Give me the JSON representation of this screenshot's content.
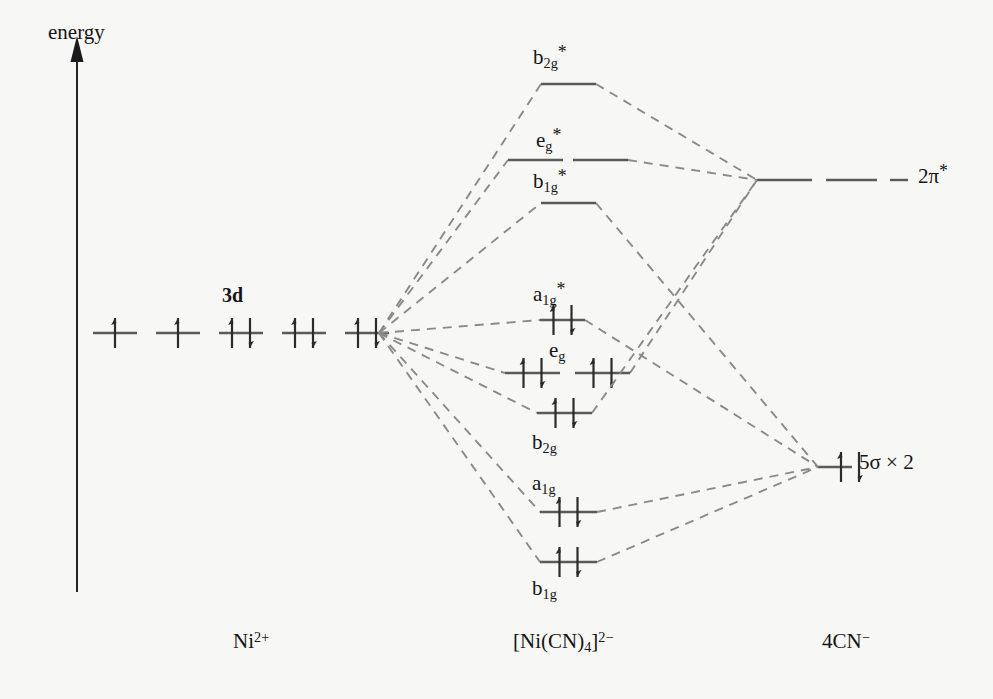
{
  "diagram": {
    "axis": {
      "label": "energy",
      "direction": "up"
    },
    "colors": {
      "background": "#f7f7f5",
      "level_line": "#5a5a5a",
      "correlation_line": "#8a8a8a",
      "axis": "#1a1a1a",
      "text": "#151515",
      "electron_arrow": "#2b2b2b"
    },
    "columns": [
      {
        "id": "metal",
        "label_text": "Ni",
        "label_sup": "2+",
        "x": 281
      },
      {
        "id": "complex",
        "label_text": "[Ni(CN)",
        "label_sub": "4",
        "label_tail": "]",
        "label_sup": "2−",
        "x": 610
      },
      {
        "id": "ligand",
        "label_text": "4CN",
        "label_sup": "−",
        "x": 855
      }
    ],
    "bottom_labels": [
      {
        "name": "metal-label",
        "html": "Ni<sup>2+</sup>",
        "x": 233,
        "y": 630
      },
      {
        "name": "complex-label",
        "html": "[Ni(CN)<sub>4</sub>]<sup>2−</sup>",
        "x": 513,
        "y": 630
      },
      {
        "name": "ligand-label",
        "html": "4CN<sup>−</sup>",
        "x": 822,
        "y": 630
      }
    ],
    "metal_levels": {
      "group_label": "3d",
      "group_label_x": 222,
      "group_label_y": 285,
      "y": 333,
      "orbitals": [
        {
          "x": 93,
          "width": 44,
          "electrons": "up"
        },
        {
          "x": 156,
          "width": 44,
          "electrons": "up"
        },
        {
          "x": 219,
          "width": 44,
          "electrons": "pair"
        },
        {
          "x": 282,
          "width": 44,
          "electrons": "pair"
        },
        {
          "x": 345,
          "width": 44,
          "electrons": "pair"
        }
      ],
      "converge_x": 379,
      "converge_y": 333
    },
    "mo_levels": [
      {
        "id": "b2g-star",
        "label": "b<sub>2g</sub><span class='star'>*</span>",
        "label_x": 533,
        "label_y": 44,
        "y": 84,
        "segments": [
          [
            541,
            596
          ]
        ],
        "electrons": "none",
        "from": "metal",
        "to": "pi-star"
      },
      {
        "id": "eg-star",
        "label": "e<sub>g</sub><span class='star'>*</span>",
        "label_x": 536,
        "label_y": 127,
        "y": 160,
        "segments": [
          [
            508,
            563
          ],
          [
            573,
            628
          ]
        ],
        "electrons": "none",
        "from": "metal",
        "to": "pi-star"
      },
      {
        "id": "b1g-star",
        "label": "b<sub>1g</sub><span class='star'>*</span>",
        "label_x": 533,
        "label_y": 168,
        "y": 203,
        "segments": [
          [
            541,
            596
          ]
        ],
        "electrons": "none",
        "from": "metal",
        "to": "sigma"
      },
      {
        "id": "a1g-star",
        "label": "a<sub>1g</sub><span class='star'>*</span>",
        "label_x": 533,
        "label_y": 281,
        "y": 320,
        "segments": [
          [
            540,
            585
          ]
        ],
        "electrons": "pair",
        "from": "metal",
        "to": "sigma"
      },
      {
        "id": "eg",
        "label": "e<sub>g</sub>",
        "label_x": 549,
        "label_y": 340,
        "y": 373,
        "segments": [
          [
            505,
            560
          ],
          [
            575,
            630
          ]
        ],
        "electrons": "pair-both",
        "from": "metal",
        "to": "pi-star"
      },
      {
        "id": "b2g",
        "label": "b<sub>2g</sub>",
        "label_x": 532,
        "label_y": 432,
        "y": 413,
        "segments": [
          [
            537,
            592
          ]
        ],
        "electrons": "pair",
        "from": "metal",
        "to": "pi-star"
      },
      {
        "id": "a1g",
        "label": "a<sub>1g</sub>",
        "label_x": 532,
        "label_y": 473,
        "y": 512,
        "segments": [
          [
            540,
            597
          ]
        ],
        "electrons": "pair",
        "from": "metal",
        "to": "sigma"
      },
      {
        "id": "b1g",
        "label": "b<sub>1g</sub>",
        "label_x": 532,
        "label_y": 578,
        "y": 562,
        "segments": [
          [
            540,
            597
          ]
        ],
        "electrons": "pair",
        "from": "metal",
        "to": "sigma"
      }
    ],
    "ligand_levels": [
      {
        "id": "pi-star",
        "label": "2π<span class='star'>*</span>",
        "label_x": 918,
        "label_y": 163,
        "y": 180,
        "segments": [
          [
            757,
            812
          ],
          [
            826,
            877
          ],
          [
            890,
            908
          ]
        ],
        "electrons": "none",
        "converge_x": 757
      },
      {
        "id": "sigma",
        "label": "5σ × 2",
        "label_x": 859,
        "label_y": 452,
        "y": 467,
        "segments": [
          [
            818,
            852
          ]
        ],
        "electrons": "pair",
        "converge_x": 818
      }
    ],
    "energy_axis": {
      "x": 77,
      "top_y": 48,
      "bottom_y": 592,
      "label_x": 48,
      "label_y": 22
    }
  }
}
